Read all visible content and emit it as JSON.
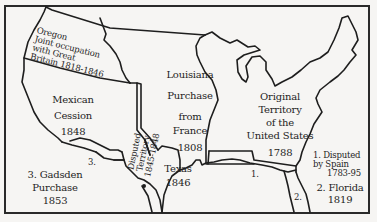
{
  "map": {
    "title": "Territorial Growth of the United States",
    "regions": [
      {
        "id": "oregon",
        "lines": [
          "Oregon",
          "Joint occupation",
          "with Great",
          "Britain 1818-1846"
        ]
      },
      {
        "id": "louisiana",
        "lines": [
          "Louisiana",
          "Purchase",
          "from",
          "France",
          "1808"
        ]
      },
      {
        "id": "mexican",
        "lines": [
          "Mexican",
          "Cession",
          "1848"
        ]
      },
      {
        "id": "disputed",
        "lines": [
          "Disputed",
          "Territory",
          "1845-1848"
        ]
      },
      {
        "id": "texas",
        "lines": [
          "Texas",
          "1846"
        ]
      },
      {
        "id": "original",
        "lines": [
          "Original",
          "Territory",
          "of the",
          "United States",
          "1788"
        ]
      },
      {
        "id": "gadsden",
        "lines": [
          "3. Gadsden",
          "Purchase",
          "1853"
        ]
      }
    ],
    "markers": {
      "m1": "1.",
      "m2": "2.",
      "m3": "3."
    },
    "legend_right": {
      "item1": [
        "1. Disputed",
        "by Spain",
        "1783-95"
      ],
      "item2": [
        "2. Florida",
        "1819"
      ]
    },
    "colors": {
      "ink": "#1e1e1e",
      "paper": "#f6f5f3"
    }
  }
}
